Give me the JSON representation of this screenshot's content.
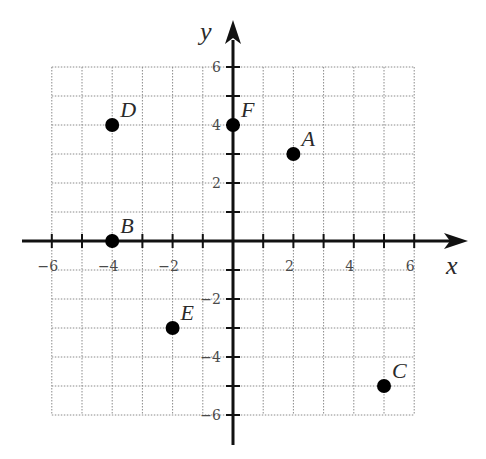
{
  "chart_data": {
    "type": "scatter",
    "title": "",
    "xlabel": "x",
    "ylabel": "y",
    "xlim": [
      -6,
      6
    ],
    "ylim": [
      -6,
      6
    ],
    "grid": true,
    "grid_step": 1,
    "x_tick_labels": [
      "−6",
      "−4",
      "−2",
      "2",
      "4",
      "6"
    ],
    "x_tick_values": [
      -6,
      -4,
      -2,
      2,
      4,
      6
    ],
    "y_tick_labels": [
      "6",
      "4",
      "2",
      "−2",
      "−4",
      "−6"
    ],
    "y_tick_values": [
      6,
      4,
      2,
      -2,
      -4,
      -6
    ],
    "legend": null,
    "points": [
      {
        "label": "A",
        "x": 2,
        "y": 3
      },
      {
        "label": "B",
        "x": -4,
        "y": 0
      },
      {
        "label": "C",
        "x": 5,
        "y": -5
      },
      {
        "label": "D",
        "x": -4,
        "y": 4
      },
      {
        "label": "E",
        "x": -2,
        "y": -3
      },
      {
        "label": "F",
        "x": 0,
        "y": 4
      }
    ]
  },
  "colors": {
    "axis": "#111111",
    "grid": "#8a8a8a",
    "point": "#000000",
    "text": "#2a2a2a"
  }
}
